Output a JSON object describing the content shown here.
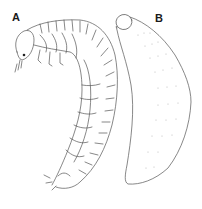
{
  "figure": {
    "panels": [
      {
        "label": "A",
        "subject": "larva, lateral view with head, legs and segmented body (curved C-shape)"
      },
      {
        "label": "B",
        "subject": "larva, smooth elongated body with small head capsule"
      }
    ],
    "colors": {
      "background": "#ffffff",
      "line": "#555555",
      "label": "#1a1a1a"
    }
  }
}
